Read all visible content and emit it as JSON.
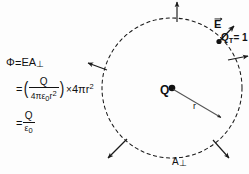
{
  "figure": {
    "background_color": "#fdfdfd",
    "stroke_color": "#1a1a1a"
  },
  "equation": {
    "line1": {
      "lhs": "Φ",
      "eq": "=",
      "rhs_E": "E",
      "rhs_A": "A",
      "rhs_A_sub": "⊥"
    },
    "line2": {
      "eq": "=",
      "paren_open": "(",
      "numerator": "Q",
      "denominator_coeff": "4πε",
      "denominator_sub": "0",
      "denominator_r": "r",
      "denominator_sup": "2",
      "paren_close": ")",
      "times": "×",
      "factor": "4πr",
      "factor_sup": "2"
    },
    "line3": {
      "eq": "=",
      "numerator": "Q",
      "denominator": "ε",
      "denominator_sub": "0"
    }
  },
  "diagram": {
    "center_charge_label": "Q",
    "radius_label": "r",
    "area_label": "A",
    "area_label_sub": "⊥",
    "field_label": "E",
    "test_charge_label": "Q",
    "test_charge_sub": "T",
    "test_charge_value": "= 1",
    "surface": {
      "type": "dashed-circle",
      "center_x": 172,
      "center_y": 88,
      "radius": 70,
      "dash_pattern": "3 3"
    },
    "radius_vector": {
      "from_x": 172,
      "from_y": 88,
      "to_x": 222,
      "to_y": 118
    },
    "field_arrows": [
      {
        "name": "arrow-top",
        "angle_deg": 90,
        "label": "up"
      },
      {
        "name": "arrow-upper-right",
        "angle_deg": 40,
        "label": "upper-right"
      },
      {
        "name": "arrow-right",
        "angle_deg": 5,
        "label": "right"
      },
      {
        "name": "arrow-upper-left",
        "angle_deg": 152,
        "label": "upper-left"
      },
      {
        "name": "arrow-lower-left",
        "angle_deg": 215,
        "label": "lower-left"
      },
      {
        "name": "arrow-lower-right",
        "angle_deg": 320,
        "label": "lower-right"
      }
    ]
  }
}
